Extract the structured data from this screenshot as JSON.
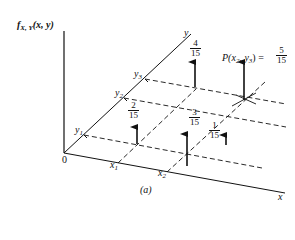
{
  "figure": {
    "caption": "(a)",
    "vertical_axis_label": {
      "f": "f",
      "sub": "X, Y",
      "args": "(x, y)"
    },
    "origin_label": "0",
    "x_axis_label": "x",
    "y_axis_label": "y",
    "x_ticks": [
      {
        "base": "x",
        "sub": "1"
      },
      {
        "base": "x",
        "sub": "2"
      }
    ],
    "y_ticks": [
      {
        "base": "y",
        "sub": "1"
      },
      {
        "base": "y",
        "sub": "2"
      },
      {
        "base": "y",
        "sub": "3"
      }
    ],
    "masses": [
      {
        "point": "(x1, y1)",
        "num": "2",
        "den": "15"
      },
      {
        "point": "(x2, y1)",
        "num": "3",
        "den": "15"
      },
      {
        "point": "(x2, y2)",
        "num": "1",
        "den": "15"
      },
      {
        "point": "(x1, y3)",
        "num": "4",
        "den": "15"
      },
      {
        "point": "(x2, y3)",
        "num": "5",
        "den": "15"
      }
    ],
    "annotation": {
      "prefix": "P(x",
      "sub1": "2",
      "mid": ", y",
      "sub2": "3",
      "suffix": ") = ",
      "num": "5",
      "den": "15"
    }
  }
}
